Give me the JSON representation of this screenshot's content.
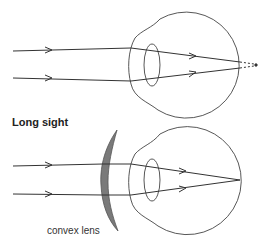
{
  "diagram": {
    "top_panel": {
      "description": "Rays focus behind the retina (uncorrected long sight)",
      "rays": 2,
      "focus_behind_retina": true
    },
    "bottom_panel": {
      "title": "Long sight",
      "lens_label": "convex lens",
      "rays": 2,
      "focus_on_retina": true
    },
    "colors": {
      "line": "#333333",
      "lens_fill": "#7a7a7a"
    }
  }
}
